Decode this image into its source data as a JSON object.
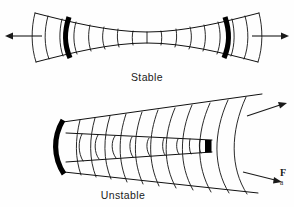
{
  "figure": {
    "width": 294,
    "height": 207,
    "background_color": "#fefefe",
    "ink_color": "#111111",
    "mirror_color": "#000000"
  },
  "panels": [
    {
      "id": "stable",
      "label": "Stable",
      "label_x": 147,
      "label_y": 81,
      "description": "Stable laser resonator with hourglass beam waist between two concave mirrors",
      "mirrors": [
        {
          "name": "left-mirror",
          "kind": "concave-arc"
        },
        {
          "name": "right-mirror",
          "kind": "concave-arc"
        }
      ],
      "arrows": [
        {
          "name": "output-beam-left",
          "direction": "left",
          "x1": 42,
          "y1": 36,
          "x2": 7,
          "y2": 36
        },
        {
          "name": "output-beam-right",
          "direction": "right",
          "x1": 252,
          "y1": 36,
          "x2": 287,
          "y2": 36
        }
      ]
    },
    {
      "id": "unstable",
      "label": "Unstable",
      "label_x": 123,
      "label_y": 199,
      "description": "Unstable laser resonator with diverging beam from large concave mirror past small convex output coupler",
      "mirrors": [
        {
          "name": "primary-concave-mirror",
          "kind": "concave-arc"
        },
        {
          "name": "secondary-convex-mirror",
          "kind": "small-block"
        }
      ],
      "arrows": [
        {
          "name": "output-beam-upper",
          "direction": "up-right",
          "x1": 247,
          "y1": 116,
          "x2": 285,
          "y2": 104
        },
        {
          "name": "output-beam-lower",
          "direction": "down-right",
          "x1": 243,
          "y1": 172,
          "x2": 281,
          "y2": 181
        }
      ]
    }
  ],
  "caption": {
    "line1": "F",
    "line2": "a"
  }
}
